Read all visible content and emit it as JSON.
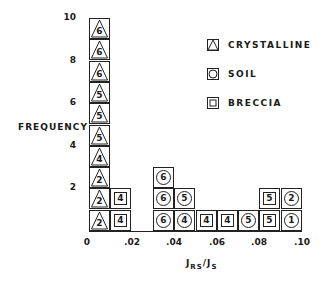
{
  "chart_data": {
    "type": "bar",
    "subtype": "stacked-symbol-histogram",
    "title": "",
    "xlabel": "J_RS/J_S",
    "ylabel": "FREQUENCY",
    "xlim": [
      0,
      0.1
    ],
    "ylim": [
      0,
      10
    ],
    "x_ticks": [
      "0",
      ".02",
      ".04",
      ".06",
      ".08",
      ".10"
    ],
    "y_ticks": [
      "2",
      "4",
      "6",
      "8",
      "10"
    ],
    "bin_width": 0.01,
    "legend": [
      {
        "key": "crystalline",
        "label": "CRYSTALLINE",
        "symbol": "triangle"
      },
      {
        "key": "soil",
        "label": "SOIL",
        "symbol": "circle"
      },
      {
        "key": "breccia",
        "label": "BRECCIA",
        "symbol": "square"
      }
    ],
    "bins": [
      {
        "range": [
          0.0,
          0.01
        ],
        "items": [
          {
            "type": "crystalline",
            "label": "2"
          },
          {
            "type": "crystalline",
            "label": "2"
          },
          {
            "type": "crystalline",
            "label": "2"
          },
          {
            "type": "crystalline",
            "label": "4"
          },
          {
            "type": "crystalline",
            "label": "5"
          },
          {
            "type": "crystalline",
            "label": "5"
          },
          {
            "type": "crystalline",
            "label": "5"
          },
          {
            "type": "crystalline",
            "label": "6"
          },
          {
            "type": "crystalline",
            "label": "6"
          },
          {
            "type": "crystalline",
            "label": "6"
          }
        ]
      },
      {
        "range": [
          0.01,
          0.02
        ],
        "items": [
          {
            "type": "breccia",
            "label": "4"
          },
          {
            "type": "breccia",
            "label": "4"
          }
        ]
      },
      {
        "range": [
          0.02,
          0.03
        ],
        "items": []
      },
      {
        "range": [
          0.03,
          0.04
        ],
        "items": [
          {
            "type": "soil",
            "label": "6"
          },
          {
            "type": "soil",
            "label": "6"
          },
          {
            "type": "soil",
            "label": "6"
          }
        ]
      },
      {
        "range": [
          0.04,
          0.05
        ],
        "items": [
          {
            "type": "soil",
            "label": "4"
          },
          {
            "type": "soil",
            "label": "5"
          }
        ]
      },
      {
        "range": [
          0.05,
          0.06
        ],
        "items": [
          {
            "type": "breccia",
            "label": "4"
          }
        ]
      },
      {
        "range": [
          0.06,
          0.07
        ],
        "items": [
          {
            "type": "breccia",
            "label": "4"
          }
        ]
      },
      {
        "range": [
          0.07,
          0.08
        ],
        "items": [
          {
            "type": "soil",
            "label": "5"
          }
        ]
      },
      {
        "range": [
          0.08,
          0.09
        ],
        "items": [
          {
            "type": "breccia",
            "label": "5"
          },
          {
            "type": "breccia",
            "label": "5"
          }
        ]
      },
      {
        "range": [
          0.09,
          0.1
        ],
        "items": [
          {
            "type": "soil",
            "label": "1"
          },
          {
            "type": "soil",
            "label": "2"
          }
        ]
      }
    ],
    "counts": [
      10,
      2,
      0,
      3,
      2,
      1,
      1,
      1,
      2,
      2
    ]
  },
  "labels": {
    "ylabel": "FREQUENCY",
    "xlabel_main": "J",
    "xlabel_sub1": "RS",
    "xlabel_slash": "/J",
    "xlabel_sub2": "S"
  }
}
